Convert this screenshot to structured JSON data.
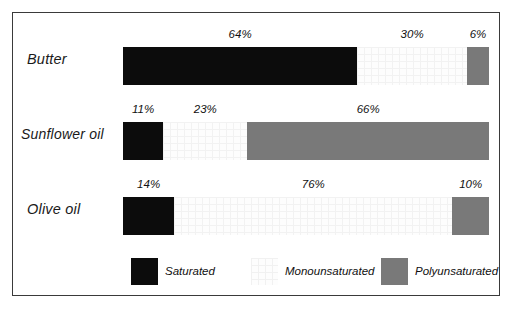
{
  "chart_data": {
    "type": "bar",
    "subtype": "stacked-horizontal-100",
    "title": "",
    "xlabel": "",
    "ylabel": "",
    "xlim": [
      0,
      100
    ],
    "grid": false,
    "legend_position": "bottom",
    "categories": [
      "Butter",
      "Sunflower oil",
      "Olive oil"
    ],
    "series": [
      {
        "name": "Saturated",
        "color": "#0c0c0c",
        "values": [
          64,
          11,
          14
        ]
      },
      {
        "name": "Monounsaturated",
        "color": "#fdfdfd",
        "values": [
          30,
          23,
          76
        ]
      },
      {
        "name": "Polyunsaturated",
        "color": "#797979",
        "values": [
          6,
          66,
          10
        ]
      }
    ],
    "value_labels": {
      "butter": [
        "64%",
        "30%",
        "6%"
      ],
      "sunflower": [
        "11%",
        "23%",
        "66%"
      ],
      "olive": [
        "14%",
        "76%",
        "10%"
      ]
    }
  },
  "rows": {
    "butter": {
      "label": "Butter",
      "saturated": {
        "value": "64%",
        "pct": 64
      },
      "monounsaturated": {
        "value": "30%",
        "pct": 30
      },
      "polyunsaturated": {
        "value": "6%",
        "pct": 6
      }
    },
    "sunflower": {
      "label": "Sunflower oil",
      "saturated": {
        "value": "11%",
        "pct": 11
      },
      "monounsaturated": {
        "value": "23%",
        "pct": 23
      },
      "polyunsaturated": {
        "value": "66%",
        "pct": 66
      }
    },
    "olive": {
      "label": "Olive oil",
      "saturated": {
        "value": "14%",
        "pct": 14
      },
      "monounsaturated": {
        "value": "76%",
        "pct": 76
      },
      "polyunsaturated": {
        "value": "10%",
        "pct": 10
      }
    }
  },
  "legend": {
    "items": [
      {
        "label": "Saturated",
        "color": "#0c0c0c"
      },
      {
        "label": "Monounsaturated",
        "color": "#fdfdfd"
      },
      {
        "label": "Polyunsaturated",
        "color": "#797979"
      }
    ]
  },
  "colors": {
    "saturated": "#0c0c0c",
    "monounsaturated": "#fdfdfd",
    "polyunsaturated": "#797979",
    "frame": "#3a3a3a",
    "text": "#111111",
    "background": "#ffffff"
  }
}
